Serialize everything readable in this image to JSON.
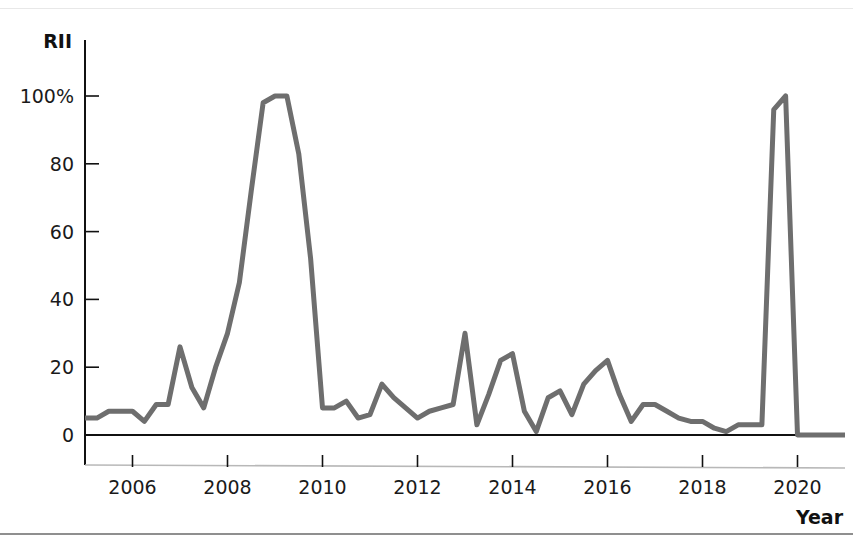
{
  "figure": {
    "background_color": "#ffffff",
    "line_color": "#6e6e6e",
    "axis_color": "#111111",
    "ylabel": "RII",
    "xlabel": "Year"
  },
  "chart_data": {
    "type": "line",
    "title": "",
    "subtitle": "",
    "xlabel": "Year",
    "ylabel": "RII",
    "grid": false,
    "legend": "none",
    "xlim": [
      2005.0,
      2021.0
    ],
    "ylim": [
      0,
      107
    ],
    "xticks": [
      2006,
      2008,
      2010,
      2012,
      2014,
      2016,
      2018,
      2020
    ],
    "xtick_labels": [
      "2006",
      "2008",
      "2010",
      "2012",
      "2014",
      "2016",
      "2018",
      "2020"
    ],
    "yticks": [
      0,
      20,
      40,
      60,
      80,
      100
    ],
    "ytick_labels": [
      "0",
      "20",
      "40",
      "60",
      "80",
      "100%"
    ],
    "series": [
      {
        "name": "RII",
        "color": "#6e6e6e",
        "x": [
          2005.0,
          2005.25,
          2005.5,
          2005.75,
          2006.0,
          2006.25,
          2006.5,
          2006.75,
          2007.0,
          2007.25,
          2007.5,
          2007.75,
          2008.0,
          2008.25,
          2008.5,
          2008.75,
          2009.0,
          2009.25,
          2009.5,
          2009.75,
          2010.0,
          2010.25,
          2010.5,
          2010.75,
          2011.0,
          2011.25,
          2011.5,
          2011.75,
          2012.0,
          2012.25,
          2012.5,
          2012.75,
          2013.0,
          2013.25,
          2013.5,
          2013.75,
          2014.0,
          2014.25,
          2014.5,
          2014.75,
          2015.0,
          2015.25,
          2015.5,
          2015.75,
          2016.0,
          2016.25,
          2016.5,
          2016.75,
          2017.0,
          2017.25,
          2017.5,
          2017.75,
          2018.0,
          2018.25,
          2018.5,
          2018.75,
          2019.0,
          2019.25,
          2019.5,
          2019.75,
          2020.0,
          2020.25,
          2020.5,
          2020.75,
          2021.0
        ],
        "y": [
          5,
          5,
          7,
          7,
          7,
          4,
          9,
          9,
          26,
          14,
          8,
          20,
          30,
          45,
          72,
          98,
          100,
          100,
          83,
          52,
          8,
          8,
          10,
          5,
          6,
          15,
          11,
          8,
          5,
          7,
          8,
          9,
          30,
          3,
          12,
          22,
          24,
          7,
          1,
          11,
          13,
          6,
          15,
          19,
          22,
          12,
          4,
          9,
          9,
          7,
          5,
          4,
          4,
          2,
          1,
          3,
          3,
          3,
          96,
          100,
          0,
          0,
          0,
          0,
          0
        ]
      }
    ],
    "annotations": []
  }
}
